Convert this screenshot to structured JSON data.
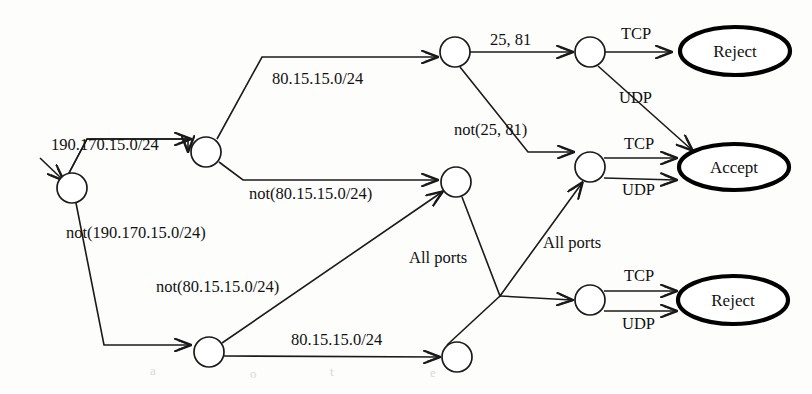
{
  "diagram": {
    "colors": {
      "stroke": "#1a1a1a",
      "terminal_stroke": "#000000",
      "node_fill": "#ffffff",
      "background": "#fdfdfc"
    },
    "nodes": [
      {
        "id": "start",
        "label": "",
        "shape": "circle",
        "cx": 72,
        "cy": 188,
        "r": 15
      },
      {
        "id": "n2",
        "label": "",
        "shape": "circle",
        "cx": 206,
        "cy": 152,
        "r": 15
      },
      {
        "id": "n3",
        "label": "",
        "shape": "circle",
        "cx": 209,
        "cy": 352,
        "r": 15
      },
      {
        "id": "n4",
        "label": "",
        "shape": "circle",
        "cx": 455,
        "cy": 52,
        "r": 15
      },
      {
        "id": "n5",
        "label": "",
        "shape": "circle",
        "cx": 456,
        "cy": 182,
        "r": 15
      },
      {
        "id": "n6",
        "label": "",
        "shape": "circle",
        "cx": 457,
        "cy": 357,
        "r": 15
      },
      {
        "id": "n7",
        "label": "",
        "shape": "circle",
        "cx": 590,
        "cy": 52,
        "r": 15
      },
      {
        "id": "n8",
        "label": "",
        "shape": "circle",
        "cx": 590,
        "cy": 167,
        "r": 15
      },
      {
        "id": "n9",
        "label": "",
        "shape": "circle",
        "cx": 590,
        "cy": 300,
        "r": 15
      }
    ],
    "terminals": [
      {
        "id": "reject-top",
        "label": "Reject",
        "cx": 735,
        "cy": 51,
        "rx": 55,
        "ry": 24
      },
      {
        "id": "accept",
        "label": "Accept",
        "cx": 734,
        "cy": 167,
        "rx": 55,
        "ry": 23
      },
      {
        "id": "reject-bottom",
        "label": "Reject",
        "cx": 733,
        "cy": 300,
        "rx": 55,
        "ry": 24
      }
    ],
    "edge_labels": [
      {
        "id": "lbl-190-170",
        "text": "190.170.15.0/24",
        "x": 51,
        "y": 150,
        "anchor": "start"
      },
      {
        "id": "lbl-not-190-170",
        "text": "not(190.170.15.0/24)",
        "x": 66,
        "y": 238,
        "anchor": "start"
      },
      {
        "id": "lbl-80-15-top",
        "text": "80.15.15.0/24",
        "x": 272,
        "y": 84,
        "anchor": "start"
      },
      {
        "id": "lbl-not-80-15-up",
        "text": "not(80.15.15.0/24)",
        "x": 249,
        "y": 199,
        "anchor": "start"
      },
      {
        "id": "lbl-not-80-15-lo",
        "text": "not(80.15.15.0/24)",
        "x": 156,
        "y": 292,
        "anchor": "start"
      },
      {
        "id": "lbl-80-15-bottom",
        "text": "80.15.15.0/24",
        "x": 291,
        "y": 345,
        "anchor": "start"
      },
      {
        "id": "lbl-25-81",
        "text": "25, 81",
        "x": 490,
        "y": 45,
        "anchor": "start"
      },
      {
        "id": "lbl-not-25-81",
        "text": "not(25, 81)",
        "x": 454,
        "y": 135,
        "anchor": "start"
      },
      {
        "id": "lbl-allports-up",
        "text": "All ports",
        "x": 409,
        "y": 263,
        "anchor": "start"
      },
      {
        "id": "lbl-allports-mid",
        "text": "All ports",
        "x": 543,
        "y": 248,
        "anchor": "start"
      },
      {
        "id": "lbl-tcp-top",
        "text": "TCP",
        "x": 621,
        "y": 39,
        "anchor": "start"
      },
      {
        "id": "lbl-udp-top",
        "text": "UDP",
        "x": 619,
        "y": 103,
        "anchor": "start"
      },
      {
        "id": "lbl-tcp-mid",
        "text": "TCP",
        "x": 624,
        "y": 149,
        "anchor": "start"
      },
      {
        "id": "lbl-udp-mid",
        "text": "UDP",
        "x": 622,
        "y": 195,
        "anchor": "start"
      },
      {
        "id": "lbl-tcp-bottom",
        "text": "TCP",
        "x": 624,
        "y": 281,
        "anchor": "start"
      },
      {
        "id": "lbl-udp-bottom",
        "text": "UDP",
        "x": 622,
        "y": 329,
        "anchor": "start"
      }
    ],
    "transitions": [
      {
        "id": "t-entry",
        "from": "",
        "to": "start",
        "label": ""
      },
      {
        "id": "t-start-n2",
        "from": "start",
        "to": "n2",
        "label": "190.170.15.0/24"
      },
      {
        "id": "t-start-n3",
        "from": "start",
        "to": "n3",
        "label": "not(190.170.15.0/24)"
      },
      {
        "id": "t-n2-n4",
        "from": "n2",
        "to": "n4",
        "label": "80.15.15.0/24"
      },
      {
        "id": "t-n2-n5",
        "from": "n2",
        "to": "n5",
        "label": "not(80.15.15.0/24)"
      },
      {
        "id": "t-n3-n5",
        "from": "n3",
        "to": "n5",
        "label": "not(80.15.15.0/24)"
      },
      {
        "id": "t-n3-n6",
        "from": "n3",
        "to": "n6",
        "label": "80.15.15.0/24"
      },
      {
        "id": "t-n4-n7",
        "from": "n4",
        "to": "n7",
        "label": "25, 81"
      },
      {
        "id": "t-n4-n8",
        "from": "n4",
        "to": "n8",
        "label": "not(25, 81)"
      },
      {
        "id": "t-n5-n8",
        "from": "n5",
        "to": "n8",
        "label": "All ports"
      },
      {
        "id": "t-n5-n9",
        "from": "n5",
        "to": "n9",
        "label": "All ports"
      },
      {
        "id": "t-n7-reject",
        "from": "n7",
        "to": "reject-top",
        "label": "TCP"
      },
      {
        "id": "t-n7-accept",
        "from": "n7",
        "to": "accept",
        "label": "UDP"
      },
      {
        "id": "t-n8-accept-tcp",
        "from": "n8",
        "to": "accept",
        "label": "TCP"
      },
      {
        "id": "t-n8-accept-udp",
        "from": "n8",
        "to": "accept",
        "label": "UDP"
      },
      {
        "id": "t-n9-reject-tcp",
        "from": "n9",
        "to": "reject-bottom",
        "label": "TCP"
      },
      {
        "id": "t-n9-reject-udp",
        "from": "n9",
        "to": "reject-bottom",
        "label": "UDP"
      }
    ]
  }
}
